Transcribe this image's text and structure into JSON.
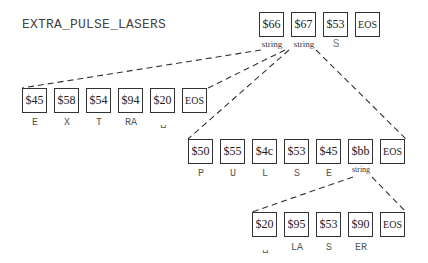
{
  "title_display": "EXTRA_PULSE_LASERS",
  "rows": [
    {
      "name": "root",
      "cells": [
        {
          "value": "$66",
          "label": "string"
        },
        {
          "value": "$67",
          "label": "string"
        },
        {
          "value": "$53",
          "label": "S"
        },
        {
          "value": "EOS",
          "label": ""
        }
      ]
    },
    {
      "name": "extra",
      "cells": [
        {
          "value": "$45",
          "label": "E"
        },
        {
          "value": "$58",
          "label": "X"
        },
        {
          "value": "$54",
          "label": "T"
        },
        {
          "value": "$94",
          "label": "RA"
        },
        {
          "value": "$20",
          "label": "␣"
        },
        {
          "value": "EOS",
          "label": ""
        }
      ]
    },
    {
      "name": "pulse",
      "cells": [
        {
          "value": "$50",
          "label": "P"
        },
        {
          "value": "$55",
          "label": "U"
        },
        {
          "value": "$4c",
          "label": "L"
        },
        {
          "value": "$53",
          "label": "S"
        },
        {
          "value": "$45",
          "label": "E"
        },
        {
          "value": "$bb",
          "label": "string"
        },
        {
          "value": "EOS",
          "label": ""
        }
      ]
    },
    {
      "name": "lasers",
      "cells": [
        {
          "value": "$20",
          "label": "␣"
        },
        {
          "value": "$95",
          "label": "LA"
        },
        {
          "value": "$53",
          "label": "S"
        },
        {
          "value": "$90",
          "label": "ER"
        },
        {
          "value": "EOS",
          "label": ""
        }
      ]
    }
  ]
}
